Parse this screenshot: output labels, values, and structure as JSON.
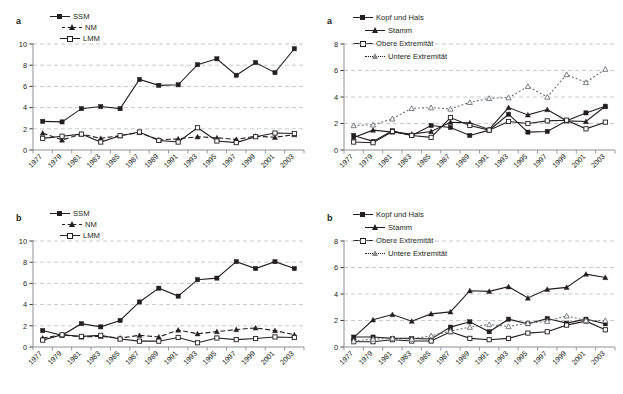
{
  "figure": {
    "background": "#ffffff",
    "ink": "#231f20",
    "grid_color": "#b9bcc2"
  },
  "panels": [
    {
      "id": "panel-a-left",
      "letter": "a",
      "position": "top-left",
      "legend_layout": "three-across",
      "chart_data": {
        "type": "line",
        "title": "",
        "xlabel": "",
        "ylabel": "",
        "grid": true,
        "legend_position": "top",
        "ylim": [
          0,
          10
        ],
        "yticks": [
          0,
          2,
          4,
          6,
          8,
          10
        ],
        "x": [
          1977,
          1979,
          1981,
          1983,
          1985,
          1987,
          1989,
          1991,
          1993,
          1995,
          1997,
          1999,
          2001,
          2003
        ],
        "categories": [
          "1977",
          "1979",
          "1981",
          "1983",
          "1985",
          "1987",
          "1989",
          "1991",
          "1993",
          "1995",
          "1997",
          "1999",
          "2001",
          "2003"
        ],
        "series": [
          {
            "name": "SSM",
            "marker": "filled-square",
            "line": "solid",
            "values": [
              2.7,
              2.65,
              3.9,
              4.1,
              3.9,
              6.65,
              6.1,
              6.15,
              8.05,
              8.6,
              7.05,
              8.25,
              7.3,
              9.55
            ]
          },
          {
            "name": "NM",
            "marker": "filled-triangle",
            "line": "dashed",
            "values": [
              1.6,
              0.95,
              1.5,
              1.1,
              1.35,
              1.65,
              0.95,
              1.05,
              1.25,
              1.15,
              1.0,
              1.3,
              1.2,
              1.45
            ]
          },
          {
            "name": "LMM",
            "marker": "open-square",
            "line": "solid",
            "values": [
              1.1,
              1.3,
              1.5,
              0.75,
              1.35,
              1.7,
              0.9,
              0.75,
              2.1,
              0.85,
              0.7,
              1.25,
              1.6,
              1.55
            ]
          }
        ]
      }
    },
    {
      "id": "panel-a-right",
      "letter": "a",
      "position": "top-right",
      "legend_layout": "two-by-two",
      "chart_data": {
        "type": "line",
        "title": "",
        "xlabel": "",
        "ylabel": "",
        "grid": true,
        "legend_position": "top",
        "ylim": [
          0,
          8
        ],
        "yticks": [
          0,
          2,
          4,
          6,
          8
        ],
        "x": [
          1977,
          1979,
          1981,
          1983,
          1985,
          1987,
          1989,
          1991,
          1993,
          1995,
          1997,
          1999,
          2001,
          2003
        ],
        "categories": [
          "1977",
          "1979",
          "1981",
          "1983",
          "1985",
          "1987",
          "1989",
          "1991",
          "1993",
          "1995",
          "1997",
          "1999",
          "2001",
          "2003"
        ],
        "series": [
          {
            "name": "Kopf und Hals",
            "marker": "filled-square",
            "line": "solid",
            "values": [
              1.1,
              0.65,
              1.45,
              1.1,
              1.85,
              1.7,
              1.1,
              1.5,
              2.7,
              1.35,
              1.4,
              2.2,
              2.8,
              3.3
            ]
          },
          {
            "name": "Stamm",
            "marker": "filled-triangle",
            "line": "solid",
            "values": [
              0.95,
              1.5,
              1.35,
              1.2,
              1.4,
              2.1,
              2.05,
              1.55,
              3.2,
              2.65,
              3.05,
              2.2,
              2.15,
              3.3
            ]
          },
          {
            "name": "Obere Extremität",
            "marker": "open-square",
            "line": "solid",
            "values": [
              0.6,
              0.55,
              1.4,
              1.1,
              0.95,
              2.45,
              1.85,
              1.5,
              2.15,
              2.0,
              2.2,
              2.25,
              1.6,
              2.1
            ]
          },
          {
            "name": "Untere Extremität",
            "marker": "open-triangle",
            "line": "dotted",
            "values": [
              1.85,
              1.9,
              2.35,
              3.15,
              3.2,
              3.1,
              3.6,
              3.9,
              3.95,
              4.8,
              4.0,
              5.7,
              5.1,
              6.1
            ]
          }
        ]
      }
    },
    {
      "id": "panel-b-left",
      "letter": "b",
      "position": "bottom-left",
      "legend_layout": "three-across",
      "chart_data": {
        "type": "line",
        "title": "",
        "xlabel": "",
        "ylabel": "",
        "grid": true,
        "legend_position": "top",
        "ylim": [
          0,
          10
        ],
        "yticks": [
          0,
          2,
          4,
          6,
          8,
          10
        ],
        "x": [
          1977,
          1979,
          1981,
          1983,
          1985,
          1987,
          1989,
          1991,
          1993,
          1995,
          1997,
          1999,
          2001,
          2003
        ],
        "categories": [
          "1977",
          "1979",
          "1981",
          "1983",
          "1985",
          "1987",
          "1989",
          "1991",
          "1993",
          "1995",
          "1997",
          "1999",
          "2001",
          "2003"
        ],
        "series": [
          {
            "name": "SSM",
            "marker": "filled-square",
            "line": "solid",
            "values": [
              1.55,
              1.1,
              2.2,
              1.9,
              2.5,
              4.25,
              5.55,
              4.8,
              6.35,
              6.5,
              8.05,
              7.4,
              8.05,
              7.4
            ]
          },
          {
            "name": "NM",
            "marker": "filled-triangle",
            "line": "dashed",
            "values": [
              0.85,
              1.15,
              0.95,
              1.0,
              0.85,
              1.1,
              0.95,
              1.6,
              1.25,
              1.45,
              1.65,
              1.8,
              1.55,
              1.15
            ]
          },
          {
            "name": "LMM",
            "marker": "open-square",
            "line": "solid",
            "values": [
              0.65,
              1.15,
              1.0,
              1.1,
              0.75,
              0.55,
              0.55,
              0.9,
              0.4,
              0.85,
              0.7,
              0.8,
              0.95,
              0.9
            ]
          }
        ]
      }
    },
    {
      "id": "panel-b-right",
      "letter": "b",
      "position": "bottom-right",
      "legend_layout": "two-by-two",
      "chart_data": {
        "type": "line",
        "title": "",
        "xlabel": "",
        "ylabel": "",
        "grid": true,
        "legend_position": "top",
        "ylim": [
          0,
          8
        ],
        "yticks": [
          0,
          2,
          4,
          6,
          8
        ],
        "x": [
          1977,
          1979,
          1981,
          1983,
          1985,
          1987,
          1989,
          1991,
          1993,
          1995,
          1997,
          1999,
          2001,
          2003
        ],
        "categories": [
          "1977",
          "1979",
          "1981",
          "1983",
          "1985",
          "1987",
          "1989",
          "1991",
          "1993",
          "1995",
          "1997",
          "1999",
          "2001",
          "2003"
        ],
        "series": [
          {
            "name": "Kopf und Hals",
            "marker": "filled-square",
            "line": "solid",
            "values": [
              0.75,
              0.75,
              0.65,
              0.65,
              0.6,
              1.5,
              1.9,
              1.15,
              2.1,
              1.75,
              2.15,
              1.8,
              2.1,
              1.75
            ]
          },
          {
            "name": "Stamm",
            "marker": "filled-triangle",
            "line": "solid",
            "values": [
              0.7,
              2.05,
              2.45,
              1.95,
              2.5,
              2.65,
              4.25,
              4.2,
              4.55,
              3.7,
              4.35,
              4.5,
              5.5,
              5.25
            ]
          },
          {
            "name": "Obere Extremität",
            "marker": "open-square",
            "line": "solid",
            "values": [
              0.4,
              0.4,
              0.55,
              0.45,
              0.45,
              1.15,
              0.65,
              0.55,
              0.65,
              1.05,
              1.15,
              1.65,
              1.95,
              1.3
            ]
          },
          {
            "name": "Untere Extremität",
            "marker": "open-triangle",
            "line": "dotted",
            "values": [
              0.45,
              0.6,
              0.65,
              0.6,
              0.85,
              1.2,
              1.5,
              1.7,
              1.55,
              1.8,
              1.95,
              2.35,
              2.0,
              2.0
            ]
          }
        ]
      }
    }
  ]
}
